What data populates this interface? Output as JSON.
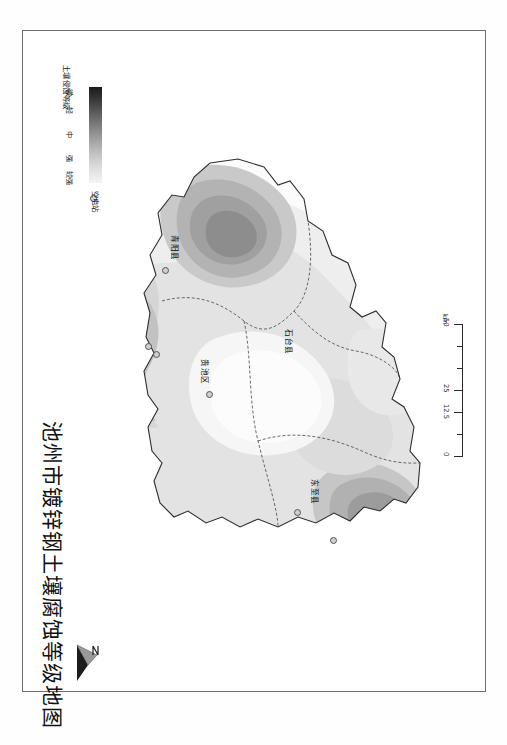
{
  "document": {
    "title": "池州市镀锌钢土壤腐蚀等级地图"
  },
  "legend": {
    "title": "土壤侵蚀等级",
    "grades": [
      "微",
      "轻",
      "中",
      "强",
      "较强"
    ],
    "station_label": "空电站",
    "station_icon": "circle-marker-icon",
    "ramp_dark": "#1a1a1a",
    "ramp_light": "#f4f4f4"
  },
  "scalebar": {
    "ticks": [
      "0",
      "12.5",
      "25",
      "50"
    ],
    "unit": "km"
  },
  "north_arrow": {
    "label": "N",
    "icon": "north-arrow-icon"
  },
  "map": {
    "counties": [
      {
        "name": "青阳县",
        "x": 152,
        "y": 205
      },
      {
        "name": "贵池区",
        "x": 182,
        "y": 330
      },
      {
        "name": "石台县",
        "x": 266,
        "y": 300
      },
      {
        "name": "东至县",
        "x": 292,
        "y": 450
      }
    ],
    "stations": [
      {
        "x": 137,
        "y": 233
      },
      {
        "x": 121,
        "y": 310
      },
      {
        "x": 129,
        "y": 318
      },
      {
        "x": 181,
        "y": 357
      },
      {
        "x": 269,
        "y": 476
      },
      {
        "x": 306,
        "y": 504
      }
    ]
  }
}
